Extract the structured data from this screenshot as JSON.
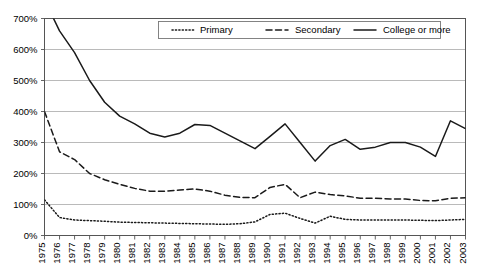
{
  "chart_data": {
    "type": "line",
    "title": "",
    "subtitle": "",
    "xlabel": "",
    "ylabel": "",
    "ylim": [
      0,
      700
    ],
    "yticks": [
      0,
      100,
      200,
      300,
      400,
      500,
      600,
      700
    ],
    "ytick_labels": [
      "0%",
      "100%",
      "200%",
      "300%",
      "400%",
      "500%",
      "600%",
      "700%"
    ],
    "grid": true,
    "legend_position": "top-center",
    "x": [
      1975,
      1976,
      1977,
      1978,
      1979,
      1980,
      1981,
      1982,
      1983,
      1984,
      1985,
      1986,
      1987,
      1988,
      1989,
      1990,
      1991,
      1992,
      1993,
      1994,
      1995,
      1996,
      1997,
      1998,
      1999,
      2000,
      2001,
      2002,
      2003
    ],
    "xtick_labels": [
      "1975",
      "1976",
      "1977",
      "1978",
      "1979",
      "1980",
      "1981",
      "1982",
      "1983",
      "1984",
      "1985",
      "1986",
      "1987",
      "1988",
      "1989",
      "1990",
      "1991",
      "1992",
      "1993",
      "1994",
      "1995",
      "1996",
      "1997",
      "1998",
      "1999",
      "2000",
      "2001",
      "2002",
      "2003"
    ],
    "series": [
      {
        "name": "Primary",
        "style": "dotted",
        "values": [
          115,
          58,
          50,
          48,
          46,
          43,
          42,
          41,
          40,
          39,
          38,
          37,
          36,
          38,
          44,
          68,
          72,
          55,
          40,
          62,
          52,
          50,
          50,
          50,
          50,
          49,
          48,
          50,
          52
        ]
      },
      {
        "name": "Secondary",
        "style": "dashed",
        "values": [
          400,
          270,
          245,
          200,
          180,
          165,
          152,
          143,
          143,
          147,
          150,
          143,
          130,
          123,
          122,
          155,
          165,
          122,
          140,
          132,
          128,
          120,
          120,
          118,
          118,
          113,
          112,
          120,
          122
        ]
      },
      {
        "name": "College or more",
        "style": "solid",
        "values": [
          760,
          660,
          590,
          500,
          430,
          385,
          360,
          330,
          318,
          330,
          358,
          355,
          330,
          305,
          280,
          320,
          360,
          300,
          240,
          290,
          310,
          278,
          285,
          300,
          300,
          285,
          255,
          370,
          345
        ]
      }
    ]
  },
  "legend": {
    "items": [
      {
        "label": "Primary",
        "style": "dotted"
      },
      {
        "label": "Secondary",
        "style": "dashed"
      },
      {
        "label": "College or more",
        "style": "solid"
      }
    ]
  }
}
